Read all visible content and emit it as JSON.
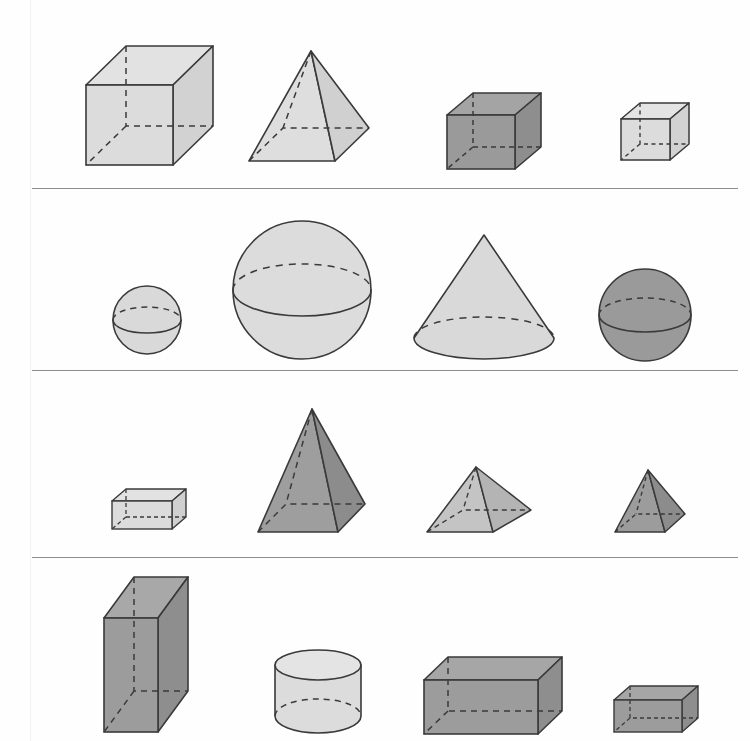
{
  "page": {
    "background_color": "#fefefe",
    "stroke_color": "#3a3a3a",
    "divider_color": "#8e8e8e",
    "width": 750,
    "height": 741
  },
  "palette": {
    "light_fill": "#d9d9d9",
    "light_top": "#e4e4e4",
    "light_side": "#cfcfcf",
    "mid_fill": "#c9c9c9",
    "dark_fill": "#9a9a9a",
    "dark_top": "#a6a6a6",
    "dark_side": "#8f8f8f"
  },
  "dividers": [
    {
      "name": "divider-row-1",
      "y": 188,
      "x": 32,
      "width": 706
    },
    {
      "name": "divider-row-2",
      "y": 370,
      "x": 32,
      "width": 706
    },
    {
      "name": "divider-row-3",
      "y": 557,
      "x": 32,
      "width": 706
    }
  ],
  "rows": [
    {
      "name": "row-1",
      "index": 1,
      "label": "Row 1",
      "shapes": [
        {
          "name": "cube-large-light",
          "type": "cube",
          "shade": "light",
          "size": "large",
          "label": "Cube",
          "col": 1
        },
        {
          "name": "square-pyramid-light",
          "type": "square-pyramid",
          "shade": "light",
          "size": "large",
          "label": "Square pyramid",
          "col": 2
        },
        {
          "name": "cube-medium-dark",
          "type": "cube",
          "shade": "dark",
          "size": "medium",
          "label": "Cube",
          "col": 3
        },
        {
          "name": "cube-small-light",
          "type": "cube",
          "shade": "light",
          "size": "small",
          "label": "Cube",
          "col": 4
        }
      ]
    },
    {
      "name": "row-2",
      "index": 2,
      "label": "Row 2",
      "shapes": [
        {
          "name": "sphere-small-light",
          "type": "sphere",
          "shade": "light",
          "size": "small",
          "label": "Sphere",
          "col": 1
        },
        {
          "name": "sphere-large-light",
          "type": "sphere",
          "shade": "light",
          "size": "large",
          "label": "Sphere",
          "col": 2
        },
        {
          "name": "cone-light",
          "type": "cone",
          "shade": "light",
          "size": "large",
          "label": "Cone",
          "col": 3
        },
        {
          "name": "sphere-medium-dark",
          "type": "sphere",
          "shade": "dark",
          "size": "medium",
          "label": "Sphere",
          "col": 4
        }
      ]
    },
    {
      "name": "row-3",
      "index": 3,
      "label": "Row 3",
      "shapes": [
        {
          "name": "rect-prism-small-light",
          "type": "rectangular-prism",
          "shade": "light",
          "size": "small",
          "label": "Rectangular prism",
          "col": 1
        },
        {
          "name": "square-pyramid-tall-dark",
          "type": "square-pyramid",
          "shade": "dark",
          "size": "large",
          "label": "Square pyramid",
          "col": 2
        },
        {
          "name": "square-pyramid-wide-mid",
          "type": "square-pyramid",
          "shade": "mid",
          "size": "medium",
          "label": "Square pyramid",
          "col": 3
        },
        {
          "name": "square-pyramid-small-dark",
          "type": "square-pyramid",
          "shade": "dark",
          "size": "small",
          "label": "Square pyramid",
          "col": 4
        }
      ]
    },
    {
      "name": "row-4",
      "index": 4,
      "label": "Row 4",
      "shapes": [
        {
          "name": "rect-prism-tall-dark",
          "type": "rectangular-prism",
          "shade": "dark",
          "size": "large",
          "label": "Rectangular prism",
          "col": 1
        },
        {
          "name": "cylinder-light",
          "type": "cylinder",
          "shade": "light",
          "size": "medium",
          "label": "Cylinder",
          "col": 2
        },
        {
          "name": "rect-prism-wide-dark",
          "type": "rectangular-prism",
          "shade": "dark",
          "size": "large",
          "label": "Rectangular prism",
          "col": 3
        },
        {
          "name": "rect-prism-tiny-dark",
          "type": "rectangular-prism",
          "shade": "dark",
          "size": "small",
          "label": "Rectangular prism",
          "col": 4
        }
      ]
    }
  ]
}
